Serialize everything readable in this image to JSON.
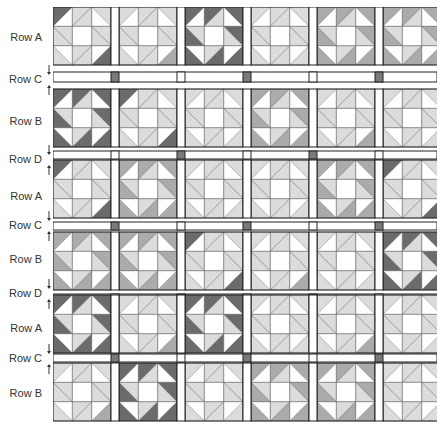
{
  "labels": [
    {
      "text": "Row A",
      "y": 31,
      "arrows": false
    },
    {
      "text": "Row C",
      "y": 73,
      "arrows": true
    },
    {
      "text": "Row B",
      "y": 115,
      "arrows": false
    },
    {
      "text": "Row D",
      "y": 153,
      "arrows": true
    },
    {
      "text": "Row A",
      "y": 190,
      "arrows": false
    },
    {
      "text": "Row C",
      "y": 219,
      "arrows": true
    },
    {
      "text": "Row B",
      "y": 253,
      "arrows": false
    },
    {
      "text": "Row D",
      "y": 287,
      "arrows": true
    },
    {
      "text": "Row A",
      "y": 322,
      "arrows": false
    },
    {
      "text": "Row C",
      "y": 352,
      "arrows": true
    },
    {
      "text": "Row B",
      "y": 387,
      "arrows": false
    }
  ],
  "colors": {
    "dark": "#6b6b6b",
    "medium": "#ababab",
    "light": "#dcdcdc",
    "white": "#ffffff",
    "line": "#222222",
    "cornerstone": "#7a7a7a"
  },
  "layout": {
    "blockSize": 58,
    "sashW": 8,
    "cols": 6
  },
  "rows": [
    {
      "type": "block",
      "label": "A",
      "y": 0,
      "h": 58,
      "blocks": [
        "L1",
        "L2",
        "D",
        "L",
        "M",
        "M"
      ]
    },
    {
      "type": "sash",
      "label": "C",
      "y": 65,
      "h": 10,
      "stones": [
        1,
        3,
        5
      ]
    },
    {
      "type": "block",
      "label": "B",
      "y": 82,
      "h": 60,
      "blocks": [
        "D",
        "L1",
        "L",
        "M",
        "L2",
        "L"
      ]
    },
    {
      "type": "sash",
      "label": "D",
      "y": 144,
      "h": 8,
      "stones": [
        2,
        4
      ]
    },
    {
      "type": "block",
      "label": "A",
      "y": 153,
      "h": 60,
      "blocks": [
        "L1",
        "M",
        "L",
        "L",
        "M",
        "L1"
      ]
    },
    {
      "type": "sash",
      "label": "C",
      "y": 215,
      "h": 8,
      "stones": [
        1,
        3,
        5
      ]
    },
    {
      "type": "block",
      "label": "B",
      "y": 225,
      "h": 60,
      "blocks": [
        "M",
        "M",
        "L1",
        "L2",
        "L",
        "D"
      ]
    },
    {
      "type": "sash",
      "label": "D",
      "y": 287,
      "h": 8,
      "stones": [
        2,
        4
      ]
    },
    {
      "type": "block",
      "label": "A",
      "y": 288,
      "h": 60,
      "blocks": [
        "D",
        "L2",
        "D",
        "L",
        "L2",
        "L"
      ]
    },
    {
      "type": "sash",
      "label": "C",
      "y": 347,
      "h": 8,
      "stones": [
        1,
        3,
        5
      ]
    },
    {
      "type": "block",
      "label": "B",
      "y": 356,
      "h": 60,
      "blocks": [
        "L2",
        "D",
        "L",
        "M",
        "M",
        "L"
      ]
    }
  ]
}
